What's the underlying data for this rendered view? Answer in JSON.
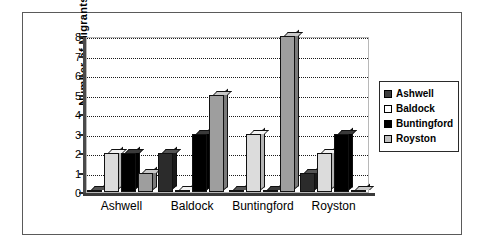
{
  "chart_data": {
    "type": "bar",
    "title": "",
    "xlabel": "",
    "ylabel": "Number of  Migrants",
    "ylim": [
      0,
      8
    ],
    "yticks": [
      0,
      1,
      2,
      3,
      4,
      5,
      6,
      7,
      8
    ],
    "grid": true,
    "legend_position": "right",
    "style": "3d-clustered-column",
    "categories": [
      "Ashwell",
      "Baldock",
      "Buntingford",
      "Royston"
    ],
    "series": [
      {
        "name": "Ashwell",
        "color": "#2b2b2b",
        "values": [
          0,
          2,
          0,
          1
        ]
      },
      {
        "name": "Baldock",
        "color": "#dcdcdc",
        "values": [
          2,
          0,
          3,
          2
        ]
      },
      {
        "name": "Buntingford",
        "color": "#000000",
        "values": [
          2,
          3,
          0,
          3
        ]
      },
      {
        "name": "Royston",
        "color": "#9e9e9e",
        "values": [
          1,
          5,
          8,
          0
        ]
      }
    ]
  },
  "legend": {
    "items": [
      {
        "label": "Ashwell"
      },
      {
        "label": "Baldock"
      },
      {
        "label": "Buntingford"
      },
      {
        "label": "Royston"
      }
    ]
  }
}
